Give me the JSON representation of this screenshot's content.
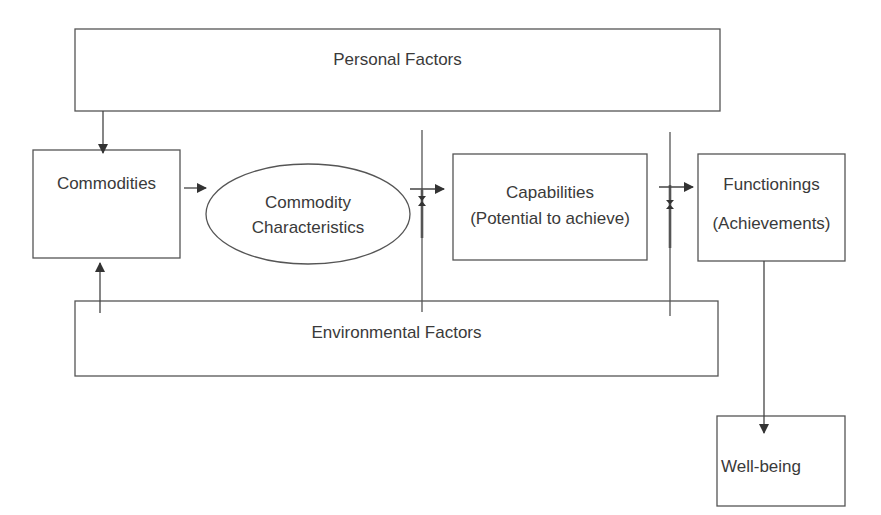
{
  "diagram": {
    "nodes": {
      "personal_factors": {
        "label": "Personal Factors"
      },
      "commodities": {
        "label": "Commodities"
      },
      "commodity_characteristics": {
        "line1": "Commodity",
        "line2": "Characteristics"
      },
      "capabilities": {
        "line1": "Capabilities",
        "line2": "(Potential to achieve)"
      },
      "functionings": {
        "line1": "Functionings",
        "line2": "(Achievements)"
      },
      "environmental_factors": {
        "label": "Environmental Factors"
      },
      "well_being": {
        "label": "Well-being"
      }
    },
    "edges": [
      {
        "from": "Personal Factors",
        "to": "Commodities"
      },
      {
        "from": "Environmental Factors",
        "to": "Commodities"
      },
      {
        "from": "Commodities",
        "to": "Commodity Characteristics"
      },
      {
        "from": "Commodity Characteristics",
        "to": "Capabilities (Potential to achieve)"
      },
      {
        "from": "Capabilities (Potential to achieve)",
        "to": "Functionings (Achievements)"
      },
      {
        "from": "Functionings (Achievements)",
        "to": "Well-being"
      }
    ],
    "stroke_color": "#444444"
  }
}
